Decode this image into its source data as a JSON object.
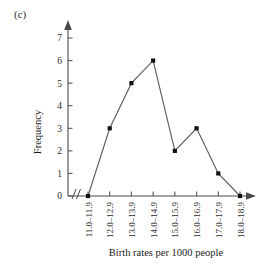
{
  "panel": {
    "label": "(c)"
  },
  "chart_data": {
    "type": "line",
    "title": "",
    "subtitle": "",
    "xlabel": "Birth rates per 1000 people",
    "ylabel": "Frequency",
    "categories": [
      "11.0–11.9",
      "12.0–12.9",
      "13.0–13.9",
      "14.0–14.9",
      "15.0–15.9",
      "16.0–16.9",
      "17.0–17.9",
      "18.0–18.9"
    ],
    "values": [
      0,
      3,
      5,
      6,
      2,
      3,
      1,
      0
    ],
    "series": [
      {
        "name": "Frequency",
        "values": [
          0,
          3,
          5,
          6,
          2,
          3,
          1,
          0
        ]
      }
    ],
    "ylim": [
      0,
      7
    ],
    "yticks": [
      0,
      1,
      2,
      3,
      4,
      5,
      6,
      7
    ],
    "ytick_labels": [
      "0",
      "1",
      "2",
      "3",
      "4",
      "5",
      "6",
      "7"
    ],
    "grid": false,
    "legend": "none",
    "marker": "filled-square",
    "axis_break_x": true,
    "axis_arrows": [
      "x-right",
      "y-top"
    ],
    "colors": {
      "line": "#5a5a5a",
      "marker": "#111111",
      "axis": "#4a4a4a",
      "text": "#1a1a1a",
      "background": "#ffffff"
    }
  }
}
